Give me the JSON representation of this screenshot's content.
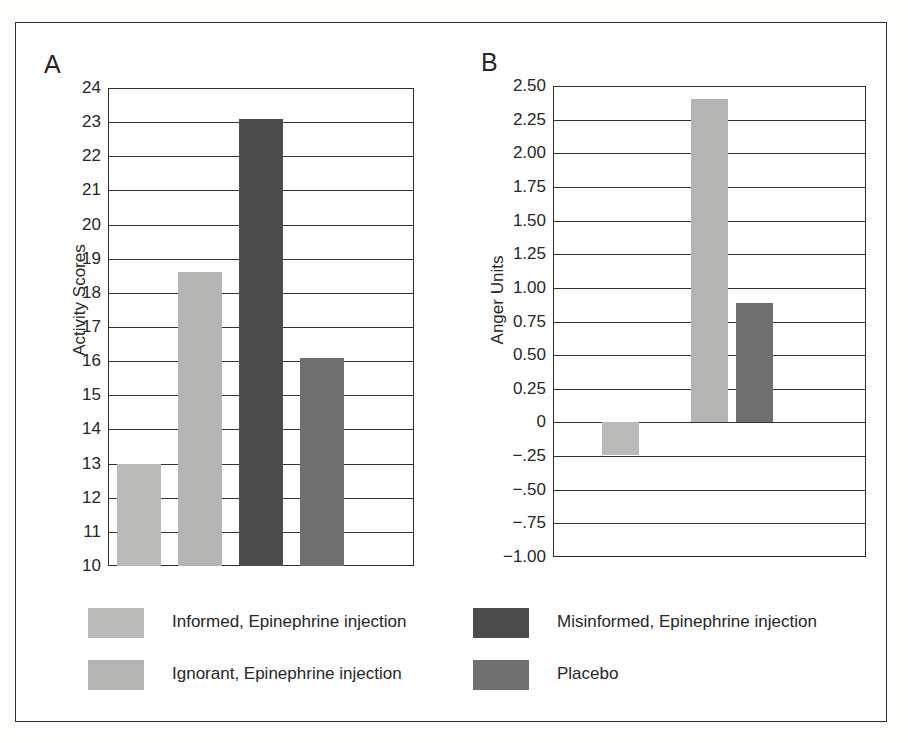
{
  "figure": {
    "panel_a_letter": "A",
    "panel_b_letter": "B"
  },
  "colors": {
    "informed": "#b9b9b7",
    "ignorant": "#b4b4b2",
    "misinformed": "#4b4b4b",
    "placebo": "#6f6f6f",
    "axis": "#2b2b2b",
    "grid": "#33332f",
    "frame": "#2e2e2e",
    "background": "#ffffff"
  },
  "legend": {
    "entries": [
      {
        "label": "Informed, Epinephrine injection",
        "color_key": "informed",
        "column": "left",
        "row": 0
      },
      {
        "label": "Ignorant, Epinephrine injection",
        "color_key": "ignorant",
        "column": "left",
        "row": 1
      },
      {
        "label": "Misinformed, Epinephrine injection",
        "color_key": "misinformed",
        "column": "right",
        "row": 0
      },
      {
        "label": "Placebo",
        "color_key": "placebo",
        "column": "right",
        "row": 1
      }
    ]
  },
  "chart_data": [
    {
      "type": "bar",
      "panel": "A",
      "title": "",
      "xlabel": "",
      "ylabel": "Activity Scores",
      "ylim": [
        10,
        24
      ],
      "ytick_labels": [
        "10",
        "11",
        "12",
        "13",
        "14",
        "15",
        "16",
        "17",
        "18",
        "19",
        "20",
        "21",
        "22",
        "23",
        "24"
      ],
      "ytick_values": [
        10,
        11,
        12,
        13,
        14,
        15,
        16,
        17,
        18,
        19,
        20,
        21,
        22,
        23,
        24
      ],
      "grid": true,
      "legend_position": "below",
      "categories": [
        "Informed, Epinephrine injection",
        "Ignorant, Epinephrine injection",
        "Misinformed, Epinephrine injection",
        "Placebo"
      ],
      "values": [
        13.0,
        18.6,
        23.1,
        16.1
      ],
      "bar_colors": [
        "#b9b9b7",
        "#b4b4b2",
        "#4b4b4b",
        "#6f6f6f"
      ],
      "baseline": 10
    },
    {
      "type": "bar",
      "panel": "B",
      "title": "",
      "xlabel": "",
      "ylabel": "Anger Units",
      "ylim": [
        -1.0,
        2.5
      ],
      "ytick_labels": [
        "−1.00",
        "−.75",
        "−.50",
        "−.25",
        "0",
        "0.25",
        "0.50",
        "0.75",
        "1.00",
        "1.25",
        "1.50",
        "1.75",
        "2.00",
        "2.25",
        "2.50"
      ],
      "ytick_values": [
        -1.0,
        -0.75,
        -0.5,
        -0.25,
        0,
        0.25,
        0.5,
        0.75,
        1.0,
        1.25,
        1.5,
        1.75,
        2.0,
        2.25,
        2.5
      ],
      "grid": true,
      "legend_position": "below",
      "categories": [
        "Informed, Epinephrine injection",
        "Ignorant, Epinephrine injection",
        "Placebo"
      ],
      "values": [
        -0.24,
        2.4,
        0.89
      ],
      "bar_colors": [
        "#b9b9b7",
        "#b4b4b2",
        "#6f6f6f"
      ],
      "baseline": 0
    }
  ]
}
